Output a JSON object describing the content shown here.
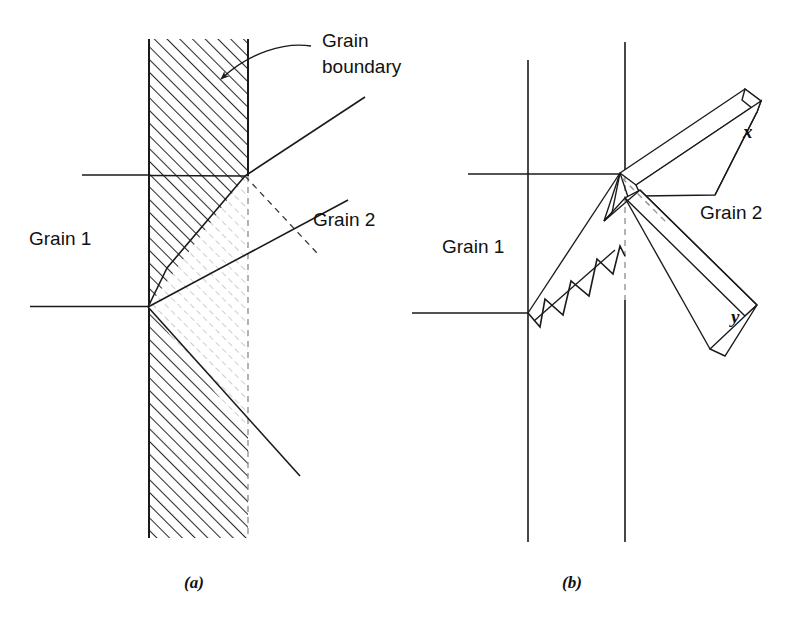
{
  "figure": {
    "width": 785,
    "height": 624,
    "background": "#ffffff",
    "ink_color": "#1a1a1a",
    "hatch_color_dark": "#2b2b2b",
    "hatch_color_light": "#b9b9b9",
    "dashed_color": "#8c8c8c"
  },
  "panel_a": {
    "caption": "(a)",
    "labels": {
      "grain1": "Grain 1",
      "grain2": "Grain 2",
      "boundary_line1": "Grain",
      "boundary_line2": "boundary"
    },
    "band": {
      "left_x": 149,
      "right_x": 248,
      "top_y": 39,
      "bottom_y": 538
    },
    "nodes": [
      {
        "name": "upper-node",
        "x": 245,
        "y": 176
      },
      {
        "name": "lower-node",
        "x": 148,
        "y": 307
      }
    ]
  },
  "panel_b": {
    "caption": "(b)",
    "labels": {
      "grain1": "Grain 1",
      "grain2": "Grain 2",
      "prism_x": "x",
      "prism_y": "y"
    },
    "vertical_lines": [
      {
        "name": "left-boundary-trace",
        "x": 528,
        "y_top": 60,
        "y_bottom": 542
      },
      {
        "name": "right-boundary-trace",
        "x": 625,
        "y_top": 42,
        "y_bottom": 542
      }
    ],
    "nodes": [
      {
        "name": "upper-node",
        "x": 620,
        "y": 173
      },
      {
        "name": "lower-node",
        "x": 528,
        "y": 313
      }
    ]
  }
}
